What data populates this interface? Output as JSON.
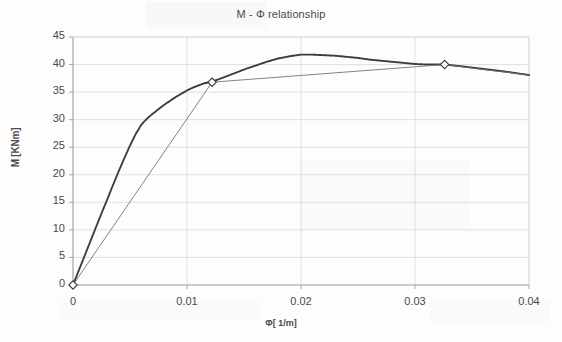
{
  "chart_data": {
    "type": "line",
    "title": "M - Φ relationship",
    "xlabel": "Φ[ 1/m]",
    "ylabel": "M [KNm]",
    "xlim": [
      0,
      0.04
    ],
    "ylim": [
      0,
      45
    ],
    "grid": true,
    "legend": "none",
    "xticks": [
      "0",
      "0.01",
      "0.02",
      "0.03",
      "0.04"
    ],
    "xtick_values": [
      0,
      0.01,
      0.02,
      0.03,
      0.04
    ],
    "yticks": [
      "0",
      "5",
      "10",
      "15",
      "20",
      "25",
      "30",
      "35",
      "40",
      "45"
    ],
    "ytick_values": [
      0,
      5,
      10,
      15,
      20,
      25,
      30,
      35,
      40,
      45
    ],
    "series": [
      {
        "name": "moment-curvature-curve",
        "style": "dotted-dark",
        "color": "#3c3c3c",
        "x": [
          0.0,
          0.0005,
          0.001,
          0.0015,
          0.002,
          0.0025,
          0.003,
          0.0035,
          0.004,
          0.0045,
          0.005,
          0.0055,
          0.006,
          0.0065,
          0.007,
          0.0075,
          0.008,
          0.0085,
          0.009,
          0.0095,
          0.01,
          0.0105,
          0.011,
          0.0115,
          0.0122,
          0.013,
          0.014,
          0.015,
          0.016,
          0.017,
          0.018,
          0.019,
          0.02,
          0.021,
          0.022,
          0.023,
          0.024,
          0.025,
          0.026,
          0.027,
          0.028,
          0.029,
          0.03,
          0.031,
          0.0326,
          0.034,
          0.036,
          0.038,
          0.04
        ],
        "y": [
          0.0,
          2.6,
          5.2,
          7.8,
          10.4,
          13.0,
          15.5,
          18.1,
          20.6,
          23.0,
          25.3,
          27.4,
          29.1,
          30.2,
          31.1,
          31.9,
          32.7,
          33.4,
          34.1,
          34.7,
          35.3,
          35.8,
          36.2,
          36.6,
          36.9,
          37.5,
          38.3,
          39.1,
          39.8,
          40.5,
          41.1,
          41.5,
          41.8,
          41.8,
          41.7,
          41.6,
          41.4,
          41.2,
          40.9,
          40.7,
          40.5,
          40.3,
          40.1,
          40.0,
          40.0,
          39.7,
          39.2,
          38.7,
          38.1
        ]
      },
      {
        "name": "bilinear-idealised-line",
        "style": "solid-thin",
        "color": "#6e6e6e",
        "x": [
          0.0,
          0.0122,
          0.0326,
          0.04
        ],
        "y": [
          0.0,
          36.8,
          40.0,
          38.1
        ]
      }
    ],
    "markers": [
      {
        "name": "origin-marker",
        "x": 0.0,
        "y": 0.0,
        "shape": "open-diamond"
      },
      {
        "name": "yield-point-marker",
        "x": 0.0122,
        "y": 36.8,
        "shape": "open-diamond"
      },
      {
        "name": "ultimate-point-marker",
        "x": 0.0326,
        "y": 40.0,
        "shape": "open-diamond"
      }
    ],
    "annotations": [],
    "colors": {
      "curve": "#3c3c3c",
      "bilinear": "#6e6e6e",
      "grid": "#d8d8d8",
      "axis": "#a8a8a8",
      "text": "#4a4a4a",
      "background": "#fdfdfd"
    }
  }
}
